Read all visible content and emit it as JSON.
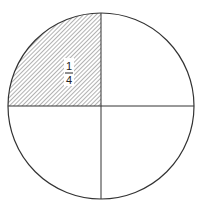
{
  "diagram": {
    "shaded_fraction": {
      "numerator": "1",
      "denominator": "4",
      "quadrant": "top-left"
    },
    "colors": {
      "stroke": "#333333",
      "hatch": "#555555",
      "background": "#ffffff"
    }
  }
}
